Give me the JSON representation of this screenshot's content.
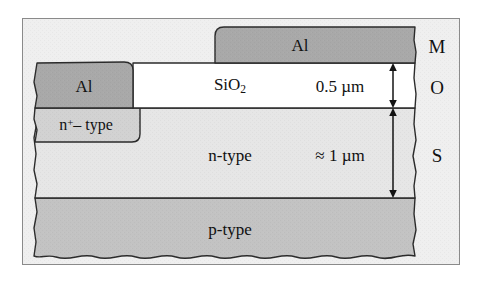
{
  "figure": {
    "kind": "mos-capacitor-cross-section",
    "panel": {
      "background_color": "#efefef",
      "border_color": "#8a8a8a"
    },
    "colors": {
      "metal_al": "#a9a9a9",
      "oxide_sio2": "#ffffff",
      "semiconductor_n": "#e6e6e6",
      "semiconductor_n_plus": "#d2d2d2",
      "semiconductor_p": "#c3c3c3",
      "outline": "#2b2b2b",
      "text": "#111111",
      "page_background": "#ffffff"
    },
    "layers": [
      {
        "id": "gate-metal",
        "label": "Al",
        "material": "aluminum",
        "role": "gate-metal",
        "fill": "#a9a9a9"
      },
      {
        "id": "contact-metal",
        "label": "Al",
        "material": "aluminum",
        "role": "ohmic-contact-metal",
        "fill": "#a9a9a9"
      },
      {
        "id": "oxide",
        "label": "SiO2",
        "label_base": "SiO",
        "label_sub": "2",
        "material": "silicon-dioxide",
        "role": "gate-oxide",
        "fill": "#ffffff"
      },
      {
        "id": "n-plus-region",
        "label_base": "n",
        "label_sup": "+",
        "label_tail": "– type",
        "label_plain": "n+– type",
        "role": "heavily-doped-contact-region",
        "fill": "#d2d2d2"
      },
      {
        "id": "n-epi",
        "label": "n-type",
        "role": "n-type-semiconductor-layer",
        "fill": "#e6e6e6"
      },
      {
        "id": "p-substrate",
        "label": "p-type",
        "role": "p-type-substrate",
        "fill": "#c3c3c3"
      }
    ],
    "dimensions": [
      {
        "id": "oxide-thickness",
        "value": "0.5 µm",
        "applies_to": "oxide",
        "arrow": "double-headed-vertical"
      },
      {
        "id": "n-layer-thickness",
        "value": "≈ 1 µm",
        "applies_to": "n-epi",
        "arrow": "double-headed-vertical"
      }
    ],
    "stack_labels": [
      {
        "id": "stack-metal",
        "text": "M",
        "meaning": "metal"
      },
      {
        "id": "stack-oxide",
        "text": "O",
        "meaning": "oxide"
      },
      {
        "id": "stack-semiconductor",
        "text": "S",
        "meaning": "semiconductor"
      }
    ]
  }
}
